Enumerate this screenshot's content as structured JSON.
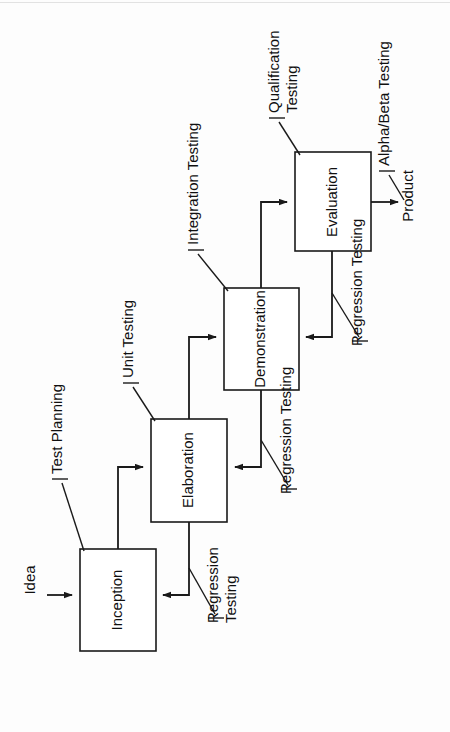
{
  "diagram": {
    "orientation": "rotated-90-ccw",
    "background_color": "#fdfdfd",
    "line_color": "#1a1a1a",
    "box_fill": "#ffffff",
    "phases": [
      {
        "id": "inception",
        "label": "Inception"
      },
      {
        "id": "elaboration",
        "label": "Elaboration"
      },
      {
        "id": "demonstration",
        "label": "Demonstration"
      },
      {
        "id": "evaluation",
        "label": "Evaluation"
      }
    ],
    "inputs": [
      {
        "id": "idea",
        "label": "Idea"
      }
    ],
    "outputs": [
      {
        "id": "product",
        "label": "Product"
      }
    ],
    "annotations": [
      {
        "id": "test-planning",
        "lines": [
          "Test Planning"
        ],
        "target": "inception"
      },
      {
        "id": "unit-testing",
        "lines": [
          "Unit Testing"
        ],
        "target": "elaboration"
      },
      {
        "id": "integration-testing",
        "lines": [
          "Integration Testing"
        ],
        "target": "demonstration"
      },
      {
        "id": "qualification-testing",
        "lines": [
          "Qualification",
          "Testing"
        ],
        "target": "evaluation"
      },
      {
        "id": "alpha-beta-testing",
        "lines": [
          "Alpha/Beta Testing"
        ],
        "target": "product"
      },
      {
        "id": "regression-testing-1",
        "lines": [
          "Regression",
          "Testing"
        ],
        "target": "elaboration-to-inception"
      },
      {
        "id": "regression-testing-2",
        "lines": [
          "Regression Testing"
        ],
        "target": "demonstration-to-elaboration"
      },
      {
        "id": "regression-testing-3",
        "lines": [
          "Regression Testing"
        ],
        "target": "evaluation-to-demonstration"
      }
    ],
    "flows": [
      {
        "id": "idea-to-inception",
        "from": "Idea",
        "to": "Inception"
      },
      {
        "id": "inception-to-elaboration",
        "from": "Inception",
        "to": "Elaboration"
      },
      {
        "id": "elaboration-to-demonstration",
        "from": "Elaboration",
        "to": "Demonstration"
      },
      {
        "id": "demonstration-to-evaluation",
        "from": "Demonstration",
        "to": "Evaluation"
      },
      {
        "id": "evaluation-to-product",
        "from": "Evaluation",
        "to": "Product"
      },
      {
        "id": "elaboration-back-to-inception",
        "from": "Elaboration",
        "to": "Inception"
      },
      {
        "id": "demonstration-back-to-elaboration",
        "from": "Demonstration",
        "to": "Elaboration"
      },
      {
        "id": "evaluation-back-to-demonstration",
        "from": "Evaluation",
        "to": "Demonstration"
      }
    ]
  }
}
